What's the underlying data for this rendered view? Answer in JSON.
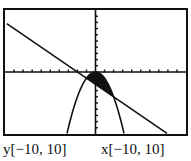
{
  "chart_data": {
    "type": "line",
    "title": "",
    "xlabel": "",
    "ylabel": "",
    "xlim": [
      -10,
      10
    ],
    "ylim": [
      -10,
      10
    ],
    "grid": false,
    "ticks": {
      "x_scale": 1,
      "y_scale": 1
    },
    "series": [
      {
        "name": "line",
        "equation": "y = -x - 2",
        "kind": "line"
      },
      {
        "name": "parabola",
        "equation": "y = -x^2",
        "kind": "curve"
      }
    ],
    "shaded_region": {
      "description": "y <= -x^2 and y >= -x - 2",
      "x_range": [
        -1,
        2
      ],
      "intersections": [
        [
          -1,
          -1
        ],
        [
          2,
          -4
        ]
      ]
    },
    "window_labels": {
      "y": "y[−10, 10]",
      "x": "x[−10, 10]"
    }
  },
  "colors": {
    "ink": "#111111",
    "background": "#ffffff"
  }
}
